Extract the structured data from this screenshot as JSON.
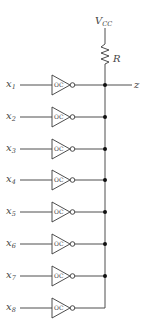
{
  "diagram": {
    "supply_label": "V",
    "supply_subscript": "CC",
    "resistor_label": "R",
    "output_label": "z",
    "gate_label": "OC",
    "inputs": [
      {
        "var": "x",
        "sub": "1"
      },
      {
        "var": "x",
        "sub": "2"
      },
      {
        "var": "x",
        "sub": "3"
      },
      {
        "var": "x",
        "sub": "4"
      },
      {
        "var": "x",
        "sub": "5"
      },
      {
        "var": "x",
        "sub": "6"
      },
      {
        "var": "x",
        "sub": "7"
      },
      {
        "var": "x",
        "sub": "8"
      }
    ],
    "colors": {
      "line": "#3a3a3a",
      "text": "#444444",
      "junction": "#111111"
    }
  }
}
